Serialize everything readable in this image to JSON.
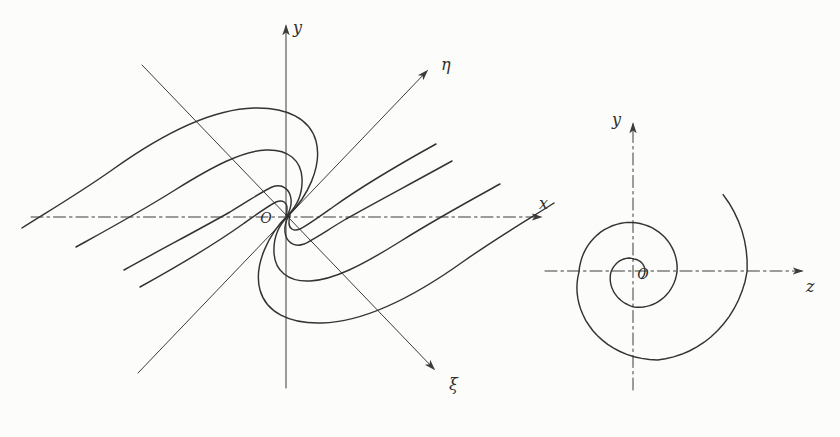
{
  "figure": {
    "ink": "#333333",
    "background": "#fcfcfa",
    "left": {
      "title": "phase portrait with rotated eigenaxes",
      "labels": {
        "x": "x",
        "y": "y",
        "eta": "η",
        "xi": "ξ",
        "origin": "O"
      },
      "origin": {
        "x": 288,
        "y": 215.5
      },
      "axes": {
        "x": {
          "x1": 31,
          "y1": 217,
          "x2": 541,
          "y2": 217,
          "style": "dash-dot"
        },
        "y": {
          "x1": 286,
          "y1": 388,
          "x2": 286,
          "y2": 26,
          "style": "solid"
        },
        "eta": {
          "x1": 138,
          "y1": 373,
          "x2": 427,
          "y2": 71,
          "style": "solid"
        },
        "xi": {
          "x1": 142,
          "y1": 65,
          "x2": 434,
          "y2": 369,
          "style": "solid"
        }
      },
      "trajectories": [
        "M 22,228 C 42,215 75,196 112,170 C 165,132 215,109 254,108 C 287,107 310,119 316,141 C 323,167 306,198 289,215",
        "M 76,247 C 105,231 140,212 175,190 C 215,165 243,151 266,150 C 289,149 301,161 302,178 C 303,197 294,209 288,215",
        "M 124,270 C 160,250 200,229 230,212 C 250,200 263,191 272,187 C 283,183 290,190 291,199 C 292,207 289,212 287,216",
        "M 140,287 C 178,266 215,244 243,224 C 257,214 268,206 276,202 C 283,199 287,203 287,208 C 287,211 287,213 286,216"
      ],
      "mirror_transform": "rotate(180 288 215.5)"
    },
    "right": {
      "title": "spiral trajectory (focus)",
      "labels": {
        "y": "y",
        "z": "z",
        "origin": "O"
      },
      "axes": {
        "z": {
          "x1": 545,
          "y1": 271,
          "x2": 802,
          "y2": 271,
          "style": "dash-dot"
        },
        "y": {
          "x1": 633,
          "y1": 390,
          "x2": 633,
          "y2": 124,
          "style": "dash-dot"
        }
      },
      "spiral": {
        "cx": 634,
        "cy": 272,
        "keys": [
          [
            41,
            118
          ],
          [
            0,
            113
          ],
          [
            -75,
            91
          ],
          [
            -180,
            55
          ],
          [
            -262,
            50
          ],
          [
            -360,
            43
          ],
          [
            -450,
            35
          ],
          [
            -540,
            23
          ],
          [
            -630,
            13
          ],
          [
            -760,
            10
          ]
        ],
        "step_deg": 5
      }
    }
  }
}
